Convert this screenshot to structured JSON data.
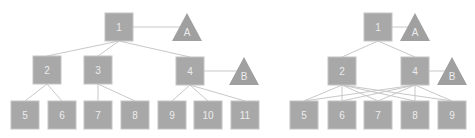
{
  "diagrams": [
    {
      "name": "hierarchy-tree",
      "nodes": [
        {
          "id": "1",
          "label": "1",
          "shape": "square"
        },
        {
          "id": "A",
          "label": "A",
          "shape": "triangle"
        },
        {
          "id": "2",
          "label": "2",
          "shape": "square"
        },
        {
          "id": "3",
          "label": "3",
          "shape": "square"
        },
        {
          "id": "4",
          "label": "4",
          "shape": "square"
        },
        {
          "id": "B",
          "label": "B",
          "shape": "triangle"
        },
        {
          "id": "5",
          "label": "5",
          "shape": "square"
        },
        {
          "id": "6",
          "label": "6",
          "shape": "square"
        },
        {
          "id": "7",
          "label": "7",
          "shape": "square"
        },
        {
          "id": "8",
          "label": "8",
          "shape": "square"
        },
        {
          "id": "9",
          "label": "9",
          "shape": "square"
        },
        {
          "id": "10",
          "label": "10",
          "shape": "square"
        },
        {
          "id": "11",
          "label": "11",
          "shape": "square"
        }
      ],
      "edges": [
        [
          "1",
          "A"
        ],
        [
          "1",
          "2"
        ],
        [
          "1",
          "3"
        ],
        [
          "1",
          "4"
        ],
        [
          "4",
          "B"
        ],
        [
          "2",
          "5"
        ],
        [
          "2",
          "6"
        ],
        [
          "3",
          "7"
        ],
        [
          "3",
          "8"
        ],
        [
          "4",
          "9"
        ],
        [
          "4",
          "10"
        ],
        [
          "4",
          "11"
        ]
      ]
    },
    {
      "name": "network-graph",
      "nodes": [
        {
          "id": "1",
          "label": "1",
          "shape": "square"
        },
        {
          "id": "A",
          "label": "A",
          "shape": "triangle"
        },
        {
          "id": "2",
          "label": "2",
          "shape": "square"
        },
        {
          "id": "4",
          "label": "4",
          "shape": "square"
        },
        {
          "id": "B",
          "label": "B",
          "shape": "triangle"
        },
        {
          "id": "5",
          "label": "5",
          "shape": "square"
        },
        {
          "id": "6",
          "label": "6",
          "shape": "square"
        },
        {
          "id": "7",
          "label": "7",
          "shape": "square"
        },
        {
          "id": "8",
          "label": "8",
          "shape": "square"
        },
        {
          "id": "9",
          "label": "9",
          "shape": "square"
        }
      ],
      "edges": [
        [
          "1",
          "A"
        ],
        [
          "1",
          "2"
        ],
        [
          "1",
          "4"
        ],
        [
          "4",
          "B"
        ],
        [
          "2",
          "5"
        ],
        [
          "2",
          "6"
        ],
        [
          "2",
          "7"
        ],
        [
          "2",
          "8"
        ],
        [
          "2",
          "9"
        ],
        [
          "4",
          "5"
        ],
        [
          "4",
          "6"
        ],
        [
          "4",
          "7"
        ],
        [
          "4",
          "8"
        ],
        [
          "4",
          "9"
        ]
      ]
    }
  ],
  "colors": {
    "node_fill": "#a8a8a8",
    "triangle_fill": "#a0a0a0",
    "edge": "#c8c8c8",
    "label": "#ececec"
  }
}
